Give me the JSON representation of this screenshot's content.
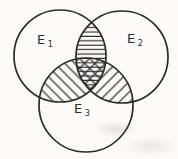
{
  "figure": {
    "kind": "venn-diagram-3-sets",
    "background_color": "#fbfaf8",
    "ink_color": "#2b2b2b",
    "sets": [
      {
        "name": "E1",
        "label": "E",
        "subscript": "1",
        "position": "top-left-circle"
      },
      {
        "name": "E2",
        "label": "E",
        "subscript": "2",
        "position": "top-right-circle"
      },
      {
        "name": "E3",
        "label": "E",
        "subscript": "3",
        "position": "bottom-center-circle"
      }
    ],
    "shaded_regions": [
      {
        "region": "E1 ∩ E2",
        "hatch": "horizontal-lines"
      },
      {
        "region": "E1 ∩ E3",
        "hatch": "diagonal-lines-backslash"
      },
      {
        "region": "E2 ∩ E3",
        "hatch": "diagonal-lines-slash"
      },
      {
        "region": "E1 ∩ E2 ∩ E3",
        "hatch": "cross-hatch-mesh"
      }
    ]
  }
}
